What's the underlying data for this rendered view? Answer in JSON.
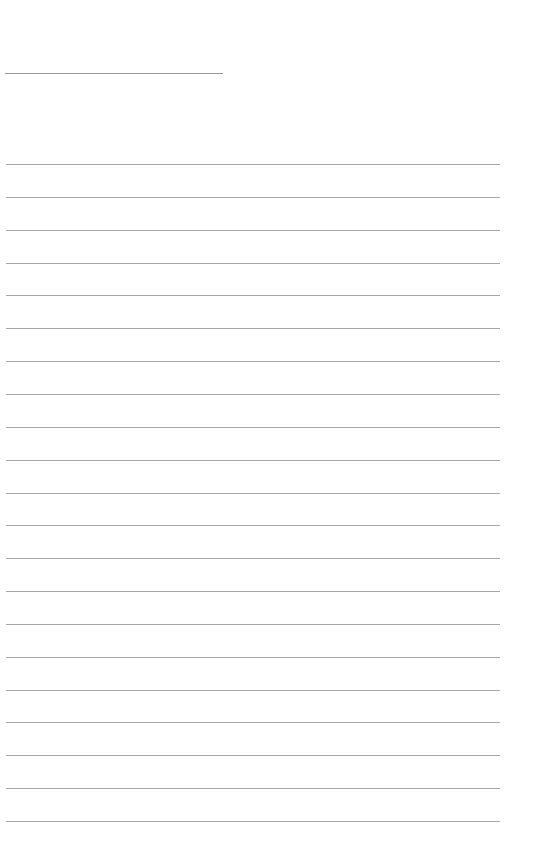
{
  "page": {
    "type": "lined-writing-sheet",
    "background_color": "#ffffff",
    "line_color": "#a8a8a8",
    "header_line": {
      "top": 73,
      "left": 5,
      "width": 218
    },
    "ruled_lines": {
      "count": 21,
      "first_top": 164,
      "spacing": 32.85,
      "left": 6,
      "width": 494
    }
  }
}
